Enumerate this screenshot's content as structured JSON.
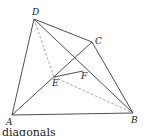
{
  "figure": {
    "points": {
      "A": {
        "x": 12,
        "y": 115,
        "label": "A",
        "lx": 6,
        "ly": 125
      },
      "B": {
        "x": 133,
        "y": 113,
        "label": "B",
        "lx": 131,
        "ly": 123
      },
      "C": {
        "x": 92,
        "y": 42,
        "label": "C",
        "lx": 95,
        "ly": 44
      },
      "D": {
        "x": 34,
        "y": 19,
        "label": "D",
        "lx": 32,
        "ly": 15
      },
      "E": {
        "x": 54,
        "y": 77,
        "label": "E",
        "lx": 52,
        "ly": 86
      },
      "F": {
        "x": 83,
        "y": 71,
        "label": "F",
        "lx": 81,
        "ly": 79
      }
    },
    "solid_segments": [
      [
        "A",
        "D"
      ],
      [
        "D",
        "C"
      ],
      [
        "C",
        "B"
      ],
      [
        "A",
        "B"
      ],
      [
        "D",
        "B"
      ],
      [
        "A",
        "C"
      ],
      [
        "E",
        "F"
      ]
    ],
    "dashed_segments": [
      [
        "D",
        "E"
      ],
      [
        "E",
        "B"
      ]
    ]
  },
  "caption": "diagonals"
}
